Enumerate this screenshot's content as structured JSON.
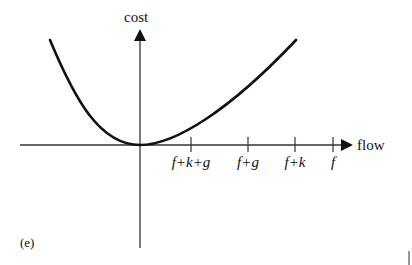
{
  "figure": {
    "panel_label": "(e)",
    "y_axis_label": "cost",
    "x_axis_label": "flow",
    "curve": {
      "description": "convex cost curve with minimum at origin",
      "left_end": [
        50,
        40
      ],
      "minimum": [
        140,
        145
      ],
      "right_end": [
        296,
        40
      ]
    },
    "x_ticks": [
      {
        "label": "f+k+g",
        "x": 191
      },
      {
        "label": "f+g",
        "x": 248
      },
      {
        "label": "f+k",
        "x": 295
      },
      {
        "label": "f",
        "x": 333
      }
    ],
    "colors": {
      "ink": "#111111",
      "axis": "#333333",
      "background": "#ffffff"
    }
  }
}
